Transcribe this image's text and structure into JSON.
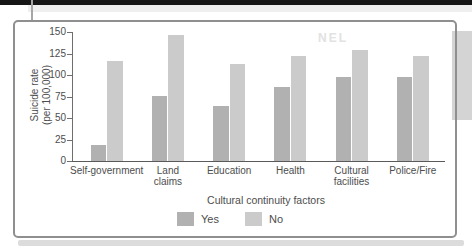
{
  "page": {
    "watermark": "NEL"
  },
  "chart_data": {
    "type": "bar",
    "title": "",
    "categories": [
      "Self-government",
      "Land claims",
      "Education",
      "Health",
      "Cultural facilities",
      "Police/Fire"
    ],
    "series": [
      {
        "name": "Yes",
        "color": "#b1b1b1",
        "values": [
          19,
          76,
          64,
          86,
          98,
          98
        ]
      },
      {
        "name": "No",
        "color": "#cbcbcb",
        "values": [
          116,
          147,
          113,
          122,
          129,
          122
        ]
      }
    ],
    "xlabel": "Cultural continuity factors",
    "ylabel": "Suicide rate (per 100,000)",
    "ylabel_lines": [
      "Suicide rate",
      "(per 100,000)"
    ],
    "yticks": [
      0,
      25,
      50,
      75,
      100,
      125,
      150
    ],
    "ylim": [
      0,
      150
    ],
    "legend_position": "bottom",
    "grid": false,
    "legend_labels": [
      "Yes",
      "No"
    ]
  }
}
